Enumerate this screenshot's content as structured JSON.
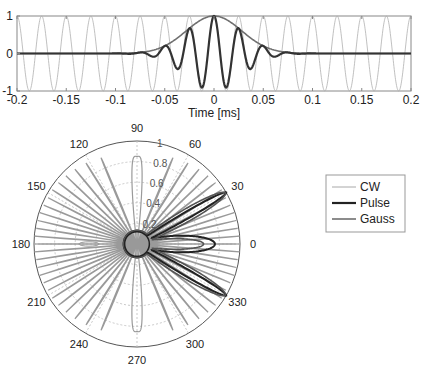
{
  "chart_data": [
    {
      "type": "line",
      "title": "",
      "xlabel": "Time [ms]",
      "ylabel": "",
      "xlim": [
        -0.2,
        0.2
      ],
      "ylim": [
        -1,
        1
      ],
      "x_ticks": [
        "-0.2",
        "-0.15",
        "-0.1",
        "-0.05",
        "0",
        "0.05",
        "0.1",
        "0.15",
        "0.2"
      ],
      "y_ticks": [
        "-1",
        "0",
        "1"
      ],
      "grid": false,
      "series": [
        {
          "name": "CW",
          "description": "continuous sine wave, amplitude 1, period ~0.025 ms",
          "period_ms": 0.025,
          "amplitude": 1,
          "color": "#b0b0b0",
          "width": 0.8
        },
        {
          "name": "Pulse",
          "description": "Gaussian-windowed cosine burst centred at t=0",
          "sigma_ms": 0.028,
          "period_ms": 0.025,
          "color": "#333333",
          "width": 2.2
        },
        {
          "name": "Gauss",
          "description": "Gaussian envelope",
          "sigma_ms": 0.028,
          "color": "#707070",
          "width": 1.6
        }
      ]
    },
    {
      "type": "polar",
      "title": "",
      "angle_ticks": [
        "0",
        "30",
        "60",
        "90",
        "120",
        "150",
        "180",
        "210",
        "240",
        "270",
        "300",
        "330"
      ],
      "radial_ticks": [
        "0.2",
        "0.4",
        "0.6",
        "0.8",
        "1"
      ],
      "rlim": [
        0,
        1
      ],
      "legend": {
        "position": "right",
        "entries": [
          "CW",
          "Pulse",
          "Gauss"
        ]
      },
      "series": [
        {
          "name": "CW",
          "description": "many narrow grating lobes spread over all angles reaching r=1",
          "color": "#9a9a9a"
        },
        {
          "name": "Pulse",
          "description": "main lobes toward +/-30 deg and 0 deg with r up to 1",
          "color": "#222222"
        },
        {
          "name": "Gauss",
          "description": "smooth lobes toward +/-30 deg and 0 deg",
          "color": "#555555"
        }
      ]
    }
  ],
  "top_plot": {
    "xlabel": "Time [ms]",
    "x_ticks": [
      "-0.2",
      "-0.15",
      "-0.1",
      "-0.05",
      "0",
      "0.05",
      "0.1",
      "0.15",
      "0.2"
    ],
    "y_ticks": [
      "1",
      "0",
      "-1"
    ]
  },
  "polar_plot": {
    "angle_labels": [
      {
        "deg": 0,
        "text": "0"
      },
      {
        "deg": 30,
        "text": "30"
      },
      {
        "deg": 60,
        "text": "60"
      },
      {
        "deg": 90,
        "text": "90"
      },
      {
        "deg": 120,
        "text": "120"
      },
      {
        "deg": 150,
        "text": "150"
      },
      {
        "deg": 180,
        "text": "180"
      },
      {
        "deg": 210,
        "text": "210"
      },
      {
        "deg": 240,
        "text": "240"
      },
      {
        "deg": 270,
        "text": "270"
      },
      {
        "deg": 300,
        "text": "300"
      },
      {
        "deg": 330,
        "text": "330"
      }
    ],
    "radial_labels": [
      "0.2",
      "0.4",
      "0.6",
      "0.8",
      "1"
    ]
  },
  "legend": {
    "entries": [
      {
        "label": "CW",
        "color": "#a8a8a8",
        "width": 1
      },
      {
        "label": "Pulse",
        "color": "#222222",
        "width": 2.2
      },
      {
        "label": "Gauss",
        "color": "#666666",
        "width": 1.5
      }
    ]
  }
}
